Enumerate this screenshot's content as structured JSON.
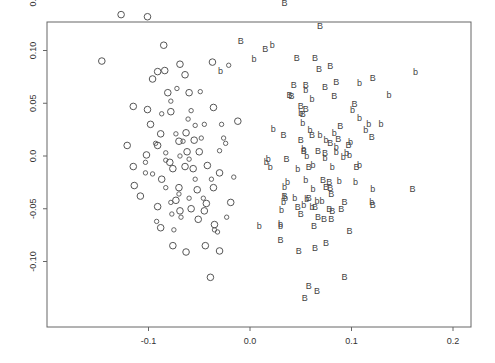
{
  "chart_data": {
    "type": "scatter",
    "title": "",
    "xlabel": "",
    "ylabel": "",
    "xlim": [
      -0.195,
      0.215
    ],
    "ylim": [
      -0.14,
      0.16
    ],
    "grid": false,
    "legend": null,
    "x_ticks": [
      {
        "value": -0.1,
        "label": "-0.1"
      },
      {
        "value": 0.0,
        "label": "0.0"
      },
      {
        "value": 0.1,
        "label": "0.1"
      },
      {
        "value": 0.2,
        "label": "0.2"
      }
    ],
    "y_ticks": [
      {
        "value": -0.1,
        "label": "-0.10"
      },
      {
        "value": -0.05,
        "label": "-0.05"
      },
      {
        "value": 0.0,
        "label": "0.0"
      },
      {
        "value": 0.05,
        "label": "0.05"
      },
      {
        "value": 0.1,
        "label": "0.10"
      },
      {
        "value": 0.15,
        "label": "0.15"
      }
    ],
    "series": [
      {
        "name": "O (large circle)",
        "marker": "O",
        "points": [
          [
            -0.127,
            0.134
          ],
          [
            -0.101,
            0.132
          ],
          [
            -0.146,
            0.09
          ],
          [
            -0.085,
            0.105
          ],
          [
            -0.069,
            0.087
          ],
          [
            -0.091,
            0.08
          ],
          [
            -0.084,
            0.081
          ],
          [
            -0.064,
            0.077
          ],
          [
            -0.115,
            0.047
          ],
          [
            -0.081,
            0.06
          ],
          [
            -0.096,
            0.073
          ],
          [
            -0.06,
            0.06
          ],
          [
            -0.037,
            0.089
          ],
          [
            -0.036,
            0.046
          ],
          [
            -0.101,
            0.044
          ],
          [
            -0.098,
            0.03
          ],
          [
            -0.078,
            0.042
          ],
          [
            -0.088,
            0.021
          ],
          [
            -0.121,
            0.01
          ],
          [
            -0.063,
            0.022
          ],
          [
            -0.102,
            0.001
          ],
          [
            -0.07,
            0.014
          ],
          [
            -0.091,
            0.01
          ],
          [
            -0.055,
            0.015
          ],
          [
            -0.079,
            -0.006
          ],
          [
            -0.062,
            0.004
          ],
          [
            -0.05,
            0.004
          ],
          [
            -0.115,
            -0.01
          ],
          [
            -0.076,
            -0.012
          ],
          [
            -0.064,
            -0.01
          ],
          [
            -0.042,
            -0.009
          ],
          [
            -0.03,
            -0.016
          ],
          [
            -0.087,
            -0.022
          ],
          [
            -0.07,
            -0.03
          ],
          [
            -0.052,
            -0.032
          ],
          [
            -0.036,
            -0.03
          ],
          [
            -0.114,
            -0.028
          ],
          [
            -0.091,
            -0.048
          ],
          [
            -0.058,
            -0.05
          ],
          [
            -0.043,
            -0.045
          ],
          [
            -0.069,
            -0.052
          ],
          [
            -0.019,
            -0.044
          ],
          [
            -0.088,
            -0.068
          ],
          [
            -0.051,
            -0.06
          ],
          [
            -0.035,
            -0.065
          ],
          [
            -0.076,
            -0.085
          ],
          [
            -0.044,
            -0.085
          ],
          [
            -0.03,
            -0.09
          ],
          [
            -0.063,
            -0.091
          ],
          [
            -0.039,
            -0.115
          ],
          [
            -0.012,
            0.033
          ],
          [
            -0.045,
            -0.052
          ],
          [
            -0.108,
            -0.038
          ],
          [
            -0.056,
            -0.012
          ],
          [
            -0.073,
            -0.042
          ]
        ]
      },
      {
        "name": "o (small circle)",
        "marker": "o",
        "points": [
          [
            -0.072,
            0.064
          ],
          [
            -0.078,
            0.052
          ],
          [
            -0.049,
            0.061
          ],
          [
            -0.087,
            0.04
          ],
          [
            -0.045,
            0.03
          ],
          [
            -0.061,
            0.035
          ],
          [
            -0.026,
            0.017
          ],
          [
            -0.093,
            0.012
          ],
          [
            -0.073,
            0.021
          ],
          [
            -0.066,
            0.014
          ],
          [
            -0.048,
            0.017
          ],
          [
            -0.03,
            0.005
          ],
          [
            -0.024,
            0.012
          ],
          [
            -0.103,
            -0.006
          ],
          [
            -0.083,
            -0.004
          ],
          [
            -0.069,
            0.0
          ],
          [
            -0.06,
            -0.003
          ],
          [
            -0.096,
            -0.017
          ],
          [
            -0.054,
            -0.022
          ],
          [
            -0.038,
            -0.022
          ],
          [
            -0.083,
            -0.03
          ],
          [
            -0.07,
            -0.036
          ],
          [
            -0.06,
            -0.04
          ],
          [
            -0.078,
            -0.044
          ],
          [
            -0.068,
            -0.058
          ],
          [
            -0.035,
            -0.07
          ],
          [
            -0.092,
            -0.062
          ],
          [
            -0.077,
            -0.055
          ],
          [
            -0.032,
            -0.072
          ],
          [
            -0.016,
            -0.02
          ],
          [
            -0.021,
            0.086
          ],
          [
            -0.103,
            -0.016
          ],
          [
            -0.046,
            -0.04
          ],
          [
            -0.083,
            0.003
          ],
          [
            -0.028,
            0.03
          ],
          [
            -0.023,
            -0.058
          ],
          [
            -0.058,
            0.043
          ],
          [
            -0.075,
            -0.07
          ],
          [
            -0.054,
            0.029
          ]
        ]
      },
      {
        "name": "B (upper-case)",
        "marker": "B",
        "points": [
          [
            0.034,
            0.145
          ],
          [
            0.069,
            0.123
          ],
          [
            -0.009,
            0.109
          ],
          [
            0.015,
            0.101
          ],
          [
            0.079,
            0.085
          ],
          [
            0.046,
            0.093
          ],
          [
            0.064,
            0.093
          ],
          [
            0.085,
            0.07
          ],
          [
            0.068,
            0.082
          ],
          [
            0.055,
            0.067
          ],
          [
            0.043,
            0.067
          ],
          [
            0.083,
            0.057
          ],
          [
            0.074,
            0.065
          ],
          [
            0.055,
            0.045
          ],
          [
            0.121,
            0.074
          ],
          [
            0.041,
            0.057
          ],
          [
            0.039,
            0.058
          ],
          [
            0.103,
            0.049
          ],
          [
            0.033,
            0.02
          ],
          [
            0.087,
            0.016
          ],
          [
            0.05,
            0.015
          ],
          [
            0.079,
            0.012
          ],
          [
            0.061,
            0.02
          ],
          [
            0.12,
            0.018
          ],
          [
            0.053,
            0.005
          ],
          [
            0.036,
            -0.003
          ],
          [
            0.067,
            0.005
          ],
          [
            0.074,
            0.003
          ],
          [
            0.097,
            0.01
          ],
          [
            0.058,
            -0.01
          ],
          [
            0.105,
            -0.01
          ],
          [
            0.078,
            -0.025
          ],
          [
            0.072,
            -0.023
          ],
          [
            0.075,
            -0.029
          ],
          [
            0.079,
            -0.03
          ],
          [
            0.08,
            -0.036
          ],
          [
            0.034,
            -0.038
          ],
          [
            0.058,
            -0.04
          ],
          [
            0.064,
            -0.048
          ],
          [
            0.078,
            -0.05
          ],
          [
            0.09,
            -0.05
          ],
          [
            0.093,
            -0.044
          ],
          [
            0.047,
            -0.048
          ],
          [
            0.121,
            -0.046
          ],
          [
            0.16,
            -0.031
          ],
          [
            0.081,
            -0.052
          ],
          [
            0.05,
            -0.055
          ],
          [
            0.063,
            -0.066
          ],
          [
            0.073,
            -0.06
          ],
          [
            0.064,
            -0.087
          ],
          [
            0.048,
            -0.09
          ],
          [
            0.075,
            -0.082
          ],
          [
            0.08,
            -0.06
          ],
          [
            0.093,
            -0.115
          ],
          [
            0.058,
            -0.123
          ],
          [
            0.066,
            -0.128
          ],
          [
            0.054,
            -0.135
          ],
          [
            0.098,
            -0.071
          ],
          [
            0.067,
            -0.058
          ],
          [
            0.05,
            0.047
          ],
          [
            0.052,
            0.04
          ],
          [
            0.089,
            0.028
          ],
          [
            0.03,
            -0.08
          ]
        ]
      },
      {
        "name": "b (lower-case)",
        "marker": "b",
        "points": [
          [
            0.022,
            0.105
          ],
          [
            0.004,
            0.092
          ],
          [
            -0.029,
            0.081
          ],
          [
            0.061,
            0.054
          ],
          [
            0.055,
            0.063
          ],
          [
            0.163,
            0.08
          ],
          [
            0.137,
            0.058
          ],
          [
            0.108,
            0.069
          ],
          [
            0.101,
            0.044
          ],
          [
            0.108,
            0.036
          ],
          [
            0.117,
            0.03
          ],
          [
            0.129,
            0.03
          ],
          [
            0.114,
            0.025
          ],
          [
            0.052,
            0.031
          ],
          [
            0.05,
            0.041
          ],
          [
            0.059,
            0.025
          ],
          [
            0.083,
            0.022
          ],
          [
            0.075,
            0.015
          ],
          [
            0.069,
            0.02
          ],
          [
            0.085,
            0.004
          ],
          [
            0.095,
            0.003
          ],
          [
            0.053,
            0.007
          ],
          [
            0.074,
            -0.002
          ],
          [
            0.085,
            0.009
          ],
          [
            0.016,
            -0.006
          ],
          [
            0.02,
            -0.01
          ],
          [
            0.062,
            -0.009
          ],
          [
            0.081,
            -0.01
          ],
          [
            0.099,
            0.013
          ],
          [
            0.098,
            0.001
          ],
          [
            0.121,
            -0.031
          ],
          [
            0.12,
            -0.044
          ],
          [
            0.037,
            -0.025
          ],
          [
            0.034,
            -0.029
          ],
          [
            0.055,
            -0.023
          ],
          [
            0.062,
            -0.031
          ],
          [
            0.056,
            -0.041
          ],
          [
            0.066,
            -0.043
          ],
          [
            0.035,
            -0.04
          ],
          [
            0.071,
            -0.043
          ],
          [
            0.009,
            -0.066
          ],
          [
            0.03,
            -0.064
          ],
          [
            0.053,
            -0.046
          ],
          [
            0.061,
            -0.048
          ],
          [
            0.03,
            -0.066
          ],
          [
            0.031,
            -0.051
          ],
          [
            0.092,
            -0.001
          ],
          [
            0.056,
            0.0
          ],
          [
            0.018,
            -0.003
          ],
          [
            0.033,
            -0.044
          ],
          [
            0.044,
            -0.04
          ],
          [
            0.104,
            -0.025
          ],
          [
            0.023,
            0.026
          ],
          [
            0.088,
            -0.024
          ],
          [
            0.108,
            -0.009
          ],
          [
            0.047,
            -0.012
          ]
        ]
      }
    ]
  }
}
